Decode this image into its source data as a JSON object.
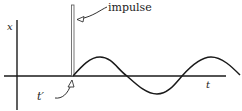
{
  "diagram": {
    "labels": {
      "y_axis": "x",
      "x_axis": "t",
      "impulse": "impulse",
      "impulse_time": "t′"
    },
    "colors": {
      "stroke": "#1a1a1a",
      "impulse_fill": "#ffffff",
      "background": "#ffffff"
    }
  }
}
